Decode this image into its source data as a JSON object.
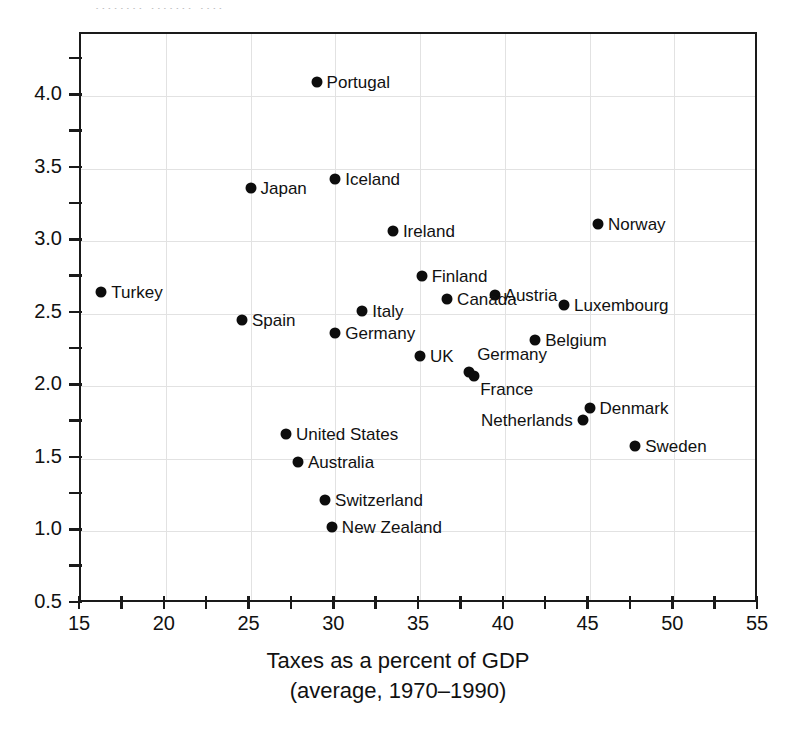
{
  "scan_artifact_text": "........ ....... ....",
  "chart_data": {
    "type": "scatter",
    "title": "",
    "xlabel_line1": "Taxes as a percent of GDP",
    "xlabel_line2": "(average, 1970–1990)",
    "ylabel": "",
    "xlim": [
      15,
      55
    ],
    "ylim": [
      0.5,
      4.43
    ],
    "xticks": [
      15,
      20,
      25,
      30,
      35,
      40,
      45,
      50,
      55
    ],
    "xtick_labels": [
      "15",
      "20",
      "25",
      "30",
      "35",
      "40",
      "45",
      "50",
      "55"
    ],
    "xminorticks": [
      17.5,
      22.5,
      27.5,
      32.5,
      37.5,
      42.5,
      47.5,
      52.5
    ],
    "yticks": [
      0.5,
      1.0,
      1.5,
      2.0,
      2.5,
      3.0,
      3.5,
      4.0
    ],
    "ytick_labels": [
      "0.5",
      "1.0",
      "1.5",
      "2.0",
      "2.5",
      "3.0",
      "3.5",
      "4.0"
    ],
    "yminorticks": [
      0.75,
      1.25,
      1.75,
      2.25,
      2.75,
      3.25,
      3.75,
      4.25
    ],
    "grid": true,
    "legend": "none",
    "point_color": "#0d0d0d",
    "points": [
      {
        "label": "Portugal",
        "x": 28.9,
        "y": 4.1,
        "label_pos": "right"
      },
      {
        "label": "Iceland",
        "x": 30.0,
        "y": 3.43,
        "label_pos": "right"
      },
      {
        "label": "Japan",
        "x": 25.0,
        "y": 3.37,
        "label_pos": "right"
      },
      {
        "label": "Norway",
        "x": 45.5,
        "y": 3.12,
        "label_pos": "right"
      },
      {
        "label": "Ireland",
        "x": 33.4,
        "y": 3.07,
        "label_pos": "right"
      },
      {
        "label": "Finland",
        "x": 35.1,
        "y": 2.76,
        "label_pos": "right"
      },
      {
        "label": "Turkey",
        "x": 16.2,
        "y": 2.65,
        "label_pos": "right"
      },
      {
        "label": "Austria",
        "x": 39.4,
        "y": 2.63,
        "label_pos": "right"
      },
      {
        "label": "Canada",
        "x": 36.6,
        "y": 2.6,
        "label_pos": "right"
      },
      {
        "label": "Luxembourg",
        "x": 43.5,
        "y": 2.56,
        "label_pos": "right"
      },
      {
        "label": "Italy",
        "x": 31.6,
        "y": 2.52,
        "label_pos": "right"
      },
      {
        "label": "Spain",
        "x": 24.5,
        "y": 2.46,
        "label_pos": "right"
      },
      {
        "label": "Germany",
        "x": 30.0,
        "y": 2.37,
        "label_pos": "right"
      },
      {
        "label": "Belgium",
        "x": 41.8,
        "y": 2.32,
        "label_pos": "right"
      },
      {
        "label": "UK",
        "x": 35.0,
        "y": 2.21,
        "label_pos": "right"
      },
      {
        "label": "Germany",
        "x": 37.9,
        "y": 2.1,
        "label_pos": "above-left"
      },
      {
        "label": "France",
        "x": 38.2,
        "y": 2.07,
        "label_pos": "below-right"
      },
      {
        "label": "Denmark",
        "x": 45.0,
        "y": 1.85,
        "label_pos": "right"
      },
      {
        "label": "Netherlands",
        "x": 44.6,
        "y": 1.77,
        "label_pos": "left"
      },
      {
        "label": "United States",
        "x": 27.1,
        "y": 1.67,
        "label_pos": "right"
      },
      {
        "label": "Sweden",
        "x": 47.7,
        "y": 1.59,
        "label_pos": "right"
      },
      {
        "label": "Australia",
        "x": 27.8,
        "y": 1.48,
        "label_pos": "right"
      },
      {
        "label": "Switzerland",
        "x": 29.4,
        "y": 1.22,
        "label_pos": "right"
      },
      {
        "label": "New Zealand",
        "x": 29.8,
        "y": 1.03,
        "label_pos": "right"
      }
    ]
  }
}
